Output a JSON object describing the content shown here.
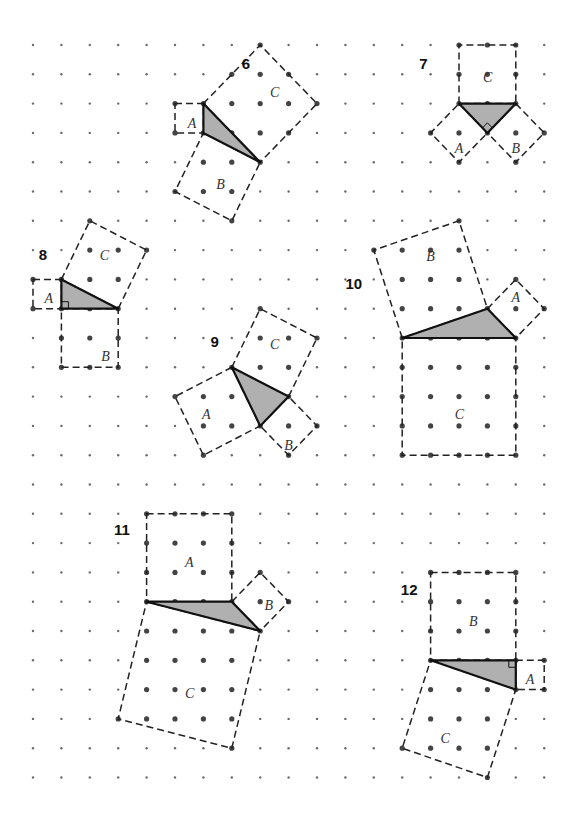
{
  "grid": {
    "origin_x": 33,
    "origin_y": 45,
    "step_x": 28.4,
    "step_y": 29.3,
    "cols": 19,
    "rows": 26
  },
  "colors": {
    "triangle_fill": "#b0b0b0",
    "outline": "#111111",
    "dot": "#444444"
  },
  "figures": [
    {
      "number": "6",
      "number_pos": [
        7.35,
        0.65
      ],
      "triangle": [
        [
          6,
          2
        ],
        [
          6,
          3
        ],
        [
          8,
          4
        ]
      ],
      "right_angle": null,
      "squares": [
        {
          "label": "A",
          "points": [
            [
              5,
              2
            ],
            [
              6,
              2
            ],
            [
              6,
              3
            ],
            [
              5,
              3
            ]
          ],
          "label_pos": [
            5.45,
            2.65
          ]
        },
        {
          "label": "B",
          "points": [
            [
              6,
              3
            ],
            [
              8,
              4
            ],
            [
              7,
              6
            ],
            [
              5,
              5
            ]
          ],
          "label_pos": [
            6.45,
            4.75
          ]
        },
        {
          "label": "C",
          "points": [
            [
              6,
              2
            ],
            [
              8,
              0
            ],
            [
              10,
              2
            ],
            [
              8,
              4
            ]
          ],
          "label_pos": [
            8.35,
            1.6
          ]
        }
      ]
    },
    {
      "number": "7",
      "number_pos": [
        13.6,
        0.65
      ],
      "triangle": [
        [
          15,
          2
        ],
        [
          17,
          2
        ],
        [
          16,
          3
        ]
      ],
      "right_angle": {
        "vertex": [
          16,
          3
        ],
        "a": [
          15,
          2
        ],
        "b": [
          17,
          2
        ]
      },
      "squares": [
        {
          "label": "A",
          "points": [
            [
              15,
              2
            ],
            [
              16,
              3
            ],
            [
              15,
              4
            ],
            [
              14,
              3
            ]
          ],
          "label_pos": [
            14.85,
            3.5
          ]
        },
        {
          "label": "B",
          "points": [
            [
              17,
              2
            ],
            [
              18,
              3
            ],
            [
              17,
              4
            ],
            [
              16,
              3
            ]
          ],
          "label_pos": [
            16.85,
            3.5
          ]
        },
        {
          "label": "C",
          "points": [
            [
              15,
              2
            ],
            [
              15,
              0
            ],
            [
              17,
              0
            ],
            [
              17,
              2
            ]
          ],
          "label_pos": [
            15.85,
            1.1
          ]
        }
      ]
    },
    {
      "number": "8",
      "number_pos": [
        0.2,
        7.15
      ],
      "triangle": [
        [
          1,
          8
        ],
        [
          1,
          9
        ],
        [
          3,
          9
        ]
      ],
      "right_angle": {
        "vertex": [
          1,
          9
        ],
        "a": [
          1,
          8
        ],
        "b": [
          3,
          9
        ]
      },
      "squares": [
        {
          "label": "A",
          "points": [
            [
              0,
              8
            ],
            [
              1,
              8
            ],
            [
              1,
              9
            ],
            [
              0,
              9
            ]
          ],
          "label_pos": [
            0.4,
            8.65
          ]
        },
        {
          "label": "B",
          "points": [
            [
              1,
              9
            ],
            [
              3,
              9
            ],
            [
              3,
              11
            ],
            [
              1,
              11
            ]
          ],
          "label_pos": [
            2.4,
            10.6
          ]
        },
        {
          "label": "C",
          "points": [
            [
              1,
              8
            ],
            [
              2,
              6
            ],
            [
              4,
              7
            ],
            [
              3,
              9
            ]
          ],
          "label_pos": [
            2.35,
            7.15
          ]
        }
      ]
    },
    {
      "number": "9",
      "number_pos": [
        6.25,
        10.15
      ],
      "triangle": [
        [
          7,
          11
        ],
        [
          9,
          12
        ],
        [
          8,
          13
        ]
      ],
      "right_angle": null,
      "squares": [
        {
          "label": "A",
          "points": [
            [
              7,
              11
            ],
            [
              5,
              12
            ],
            [
              6,
              14
            ],
            [
              8,
              13
            ]
          ],
          "label_pos": [
            5.95,
            12.6
          ]
        },
        {
          "label": "B",
          "points": [
            [
              8,
              13
            ],
            [
              9,
              12
            ],
            [
              10,
              13
            ],
            [
              9,
              14
            ]
          ],
          "label_pos": [
            8.85,
            13.65
          ]
        },
        {
          "label": "C",
          "points": [
            [
              7,
              11
            ],
            [
              8,
              9
            ],
            [
              10,
              10
            ],
            [
              9,
              12
            ]
          ],
          "label_pos": [
            8.35,
            10.2
          ]
        }
      ]
    },
    {
      "number": "10",
      "number_pos": [
        11.0,
        8.15
      ],
      "triangle": [
        [
          13,
          10
        ],
        [
          16,
          9
        ],
        [
          17,
          10
        ]
      ],
      "right_angle": null,
      "squares": [
        {
          "label": "A",
          "points": [
            [
              16,
              9
            ],
            [
              17,
              8
            ],
            [
              18,
              9
            ],
            [
              17,
              10
            ]
          ],
          "label_pos": [
            16.85,
            8.6
          ]
        },
        {
          "label": "B",
          "points": [
            [
              13,
              10
            ],
            [
              12,
              7
            ],
            [
              15,
              6
            ],
            [
              16,
              9
            ]
          ],
          "label_pos": [
            13.85,
            7.2
          ]
        },
        {
          "label": "C",
          "points": [
            [
              13,
              10
            ],
            [
              17,
              10
            ],
            [
              17,
              14
            ],
            [
              13,
              14
            ]
          ],
          "label_pos": [
            14.85,
            12.6
          ]
        }
      ]
    },
    {
      "number": "11",
      "number_pos": [
        2.85,
        16.55
      ],
      "triangle": [
        [
          4,
          19
        ],
        [
          7,
          19
        ],
        [
          8,
          20
        ]
      ],
      "right_angle": null,
      "squares": [
        {
          "label": "A",
          "points": [
            [
              4,
              16
            ],
            [
              7,
              16
            ],
            [
              7,
              19
            ],
            [
              4,
              19
            ]
          ],
          "label_pos": [
            5.35,
            17.65
          ]
        },
        {
          "label": "B",
          "points": [
            [
              7,
              19
            ],
            [
              8,
              18
            ],
            [
              9,
              19
            ],
            [
              8,
              20
            ]
          ],
          "label_pos": [
            8.15,
            19.1
          ]
        },
        {
          "label": "C",
          "points": [
            [
              4,
              19
            ],
            [
              8,
              20
            ],
            [
              7,
              24
            ],
            [
              3,
              23
            ]
          ],
          "label_pos": [
            5.35,
            22.1
          ]
        }
      ]
    },
    {
      "number": "12",
      "number_pos": [
        12.95,
        18.6
      ],
      "triangle": [
        [
          14,
          21
        ],
        [
          17,
          21
        ],
        [
          17,
          22
        ]
      ],
      "right_angle": {
        "vertex": [
          17,
          21
        ],
        "a": [
          14,
          21
        ],
        "b": [
          17,
          22
        ]
      },
      "squares": [
        {
          "label": "A",
          "points": [
            [
              17,
              21
            ],
            [
              18,
              21
            ],
            [
              18,
              22
            ],
            [
              17,
              22
            ]
          ],
          "label_pos": [
            17.35,
            21.65
          ]
        },
        {
          "label": "B",
          "points": [
            [
              14,
              18
            ],
            [
              17,
              18
            ],
            [
              17,
              21
            ],
            [
              14,
              21
            ]
          ],
          "label_pos": [
            15.35,
            19.65
          ]
        },
        {
          "label": "C",
          "points": [
            [
              14,
              21
            ],
            [
              17,
              22
            ],
            [
              16,
              25
            ],
            [
              13,
              24
            ]
          ],
          "label_pos": [
            14.35,
            23.65
          ]
        }
      ]
    }
  ]
}
